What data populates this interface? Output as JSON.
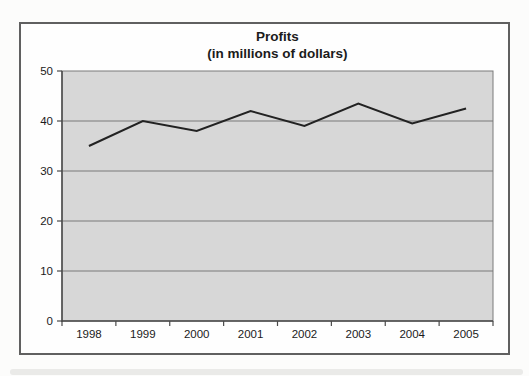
{
  "chart_data": {
    "type": "line",
    "title": "Profits",
    "subtitle": "(in millions of dollars)",
    "categories": [
      "1998",
      "1999",
      "2000",
      "2001",
      "2002",
      "2003",
      "2004",
      "2005"
    ],
    "series": [
      {
        "name": "Profits",
        "values": [
          35,
          40,
          38,
          42,
          39,
          43.5,
          39.5,
          42.5
        ]
      }
    ],
    "values": [
      35,
      40,
      38,
      42,
      39,
      43.5,
      39.5,
      42.5
    ],
    "xlabel": "",
    "ylabel": "",
    "ylim": [
      0,
      50
    ],
    "yticks": [
      0,
      10,
      20,
      30,
      40,
      50
    ],
    "grid": "horizontal",
    "legend": "none",
    "colors": {
      "plot_bg": "#d7d7d7",
      "gridline": "#7a7a7a",
      "axis": "#4a4a4a",
      "line": "#222222",
      "text": "#1b1b1b",
      "frame_border": "#606060"
    }
  }
}
